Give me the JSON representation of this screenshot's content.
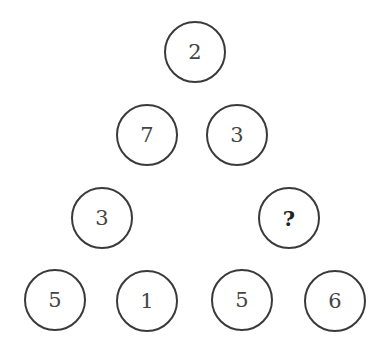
{
  "puzzle": {
    "nodes": [
      {
        "id": "top",
        "value": "2",
        "x": 195,
        "y": 52
      },
      {
        "id": "row2-left",
        "value": "7",
        "x": 147,
        "y": 135
      },
      {
        "id": "row2-right",
        "value": "3",
        "x": 237,
        "y": 135
      },
      {
        "id": "row3-left",
        "value": "3",
        "x": 102,
        "y": 218
      },
      {
        "id": "row3-right",
        "value": "?",
        "x": 289,
        "y": 218
      },
      {
        "id": "row4-1",
        "value": "5",
        "x": 55,
        "y": 300
      },
      {
        "id": "row4-2",
        "value": "1",
        "x": 147,
        "y": 301
      },
      {
        "id": "row4-3",
        "value": "5",
        "x": 242,
        "y": 300
      },
      {
        "id": "row4-4",
        "value": "6",
        "x": 335,
        "y": 301
      }
    ]
  }
}
